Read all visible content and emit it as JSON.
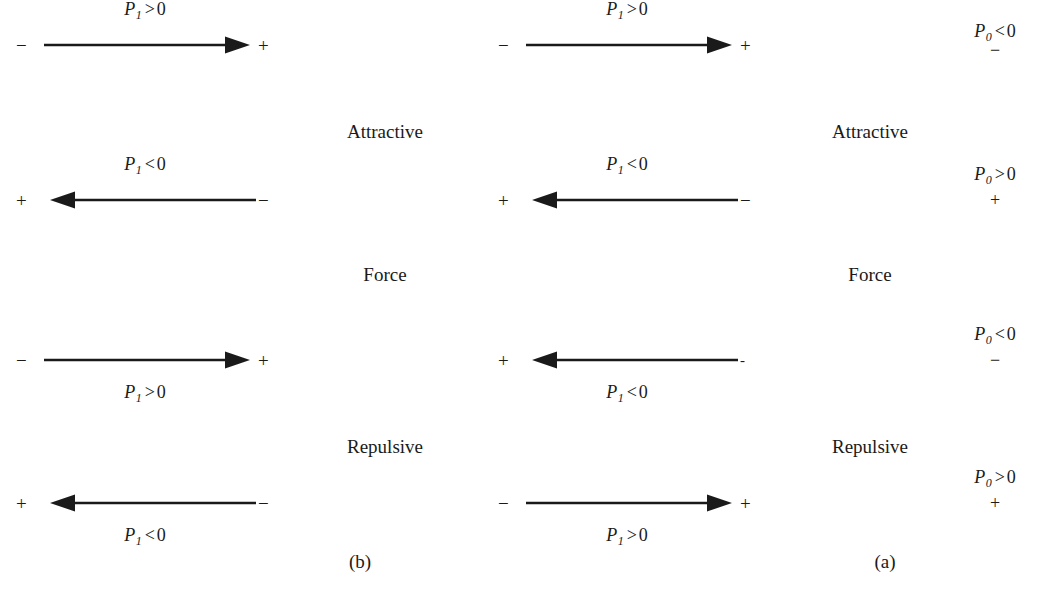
{
  "figure": {
    "panels": [
      {
        "caption": "(b)",
        "rows": [
          {
            "direction": "right",
            "left_sign": "−",
            "right_sign": "+",
            "label": {
              "symbol": "P",
              "subscript": "1",
              "relation": ">",
              "value": "0",
              "position": "above"
            }
          },
          {
            "direction": "left",
            "left_sign": "+",
            "right_sign": "−",
            "label": {
              "symbol": "P",
              "subscript": "1",
              "relation": "<",
              "value": "0",
              "position": "above"
            }
          },
          {
            "direction": "right",
            "left_sign": "−",
            "right_sign": "+",
            "label": {
              "symbol": "P",
              "subscript": "1",
              "relation": ">",
              "value": "0",
              "position": "below"
            }
          },
          {
            "direction": "left",
            "left_sign": "+",
            "right_sign": "−",
            "label": {
              "symbol": "P",
              "subscript": "1",
              "relation": "<",
              "value": "0",
              "position": "below"
            }
          }
        ]
      },
      {
        "caption": "(a)",
        "rows": [
          {
            "direction": "right",
            "left_sign": "−",
            "right_sign": "+",
            "label": {
              "symbol": "P",
              "subscript": "1",
              "relation": ">",
              "value": "0",
              "position": "above"
            }
          },
          {
            "direction": "left",
            "left_sign": "+",
            "right_sign": "−",
            "label": {
              "symbol": "P",
              "subscript": "1",
              "relation": "<",
              "value": "0",
              "position": "above"
            }
          },
          {
            "direction": "left",
            "left_sign": "+",
            "right_sign": "-",
            "label": {
              "symbol": "P",
              "subscript": "1",
              "relation": "<",
              "value": "0",
              "position": "below"
            }
          },
          {
            "direction": "right",
            "left_sign": "−",
            "right_sign": "+",
            "label": {
              "symbol": "P",
              "subscript": "1",
              "relation": ">",
              "value": "0",
              "position": "below"
            }
          }
        ]
      }
    ],
    "center_labels": [
      {
        "text": "Attractive"
      },
      {
        "text": "Force"
      },
      {
        "text": "Repulsive"
      }
    ],
    "state_labels": [
      {
        "symbol": "P",
        "subscript": "0",
        "relation": "<",
        "value": "0",
        "charge": "−"
      },
      {
        "symbol": "P",
        "subscript": "0",
        "relation": ">",
        "value": "0",
        "charge": "+"
      },
      {
        "symbol": "P",
        "subscript": "0",
        "relation": "<",
        "value": "0",
        "charge": "−"
      },
      {
        "symbol": "P",
        "subscript": "0",
        "relation": ">",
        "value": "0",
        "charge": "+"
      }
    ],
    "colors": {
      "ink": "#1a1a1a",
      "background": "#ffffff"
    }
  }
}
